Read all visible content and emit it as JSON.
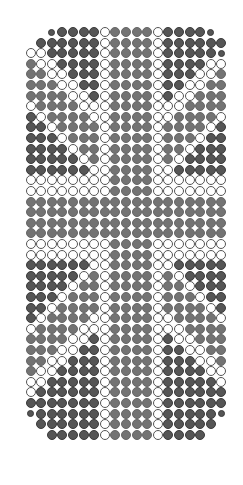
{
  "colors": {
    "dark": "#555555",
    "mid": "#737373",
    "white": "#ffffff",
    "outline": "#555555"
  },
  "grid": {
    "cols": 20,
    "rows": 40,
    "pitch_x": 10.6,
    "pitch_y": 10.6,
    "legend": {
      "D": "dark dot",
      "G": "mid-gray dot",
      "W": "white outlined dot",
      "s": "small dark dot",
      ".": "empty"
    },
    "rows_data": [
      "...sDDDDWGGGGWDDDDs.",
      "..DDDDDDWGGGGWDDDDDD",
      ".WWDDDDDWGGGGWDDDDDs",
      ".GWWDDDDWGGGGWDDDDWW",
      ".GGWWDDDWGGGGWDDDWWG",
      ".GGGWWDDWGGGGWDDWWGG",
      ".GGGGWWDWGGGGWDWWGGG",
      ".WGGGGWWWGGGGWWWGGGG",
      ".DWGGGGWWGGGGWWGGGGW",
      ".DDWGGGGWGGGGWGGGGWD",
      ".DDDWGGGWGGGGWGGGWDD",
      ".DDDDWGGWGGGGWGGWDDD",
      ".DDDDDWGWGGGGWGWDDDD",
      ".DDDDDDWWGGGGWWDDDDD",
      ".WWWWWWWWGGGGWWWWWWW",
      ".WWWWWWWWGGGGWWWWWWW",
      ".GGGGGGGGGGGGGGGGGGG",
      ".GGGGGGGGGGGGGGGGGGG",
      ".GGGGGGGGGGGGGGGGGGG",
      ".GGGGGGGGGGGGGGGGGGG",
      ".WWWWWWWWGGGGWWWWWWW",
      ".WWWWWWWWGGGGWWWWWWW",
      ".DDDDDDWWGGGGWWDDDDD",
      ".DDDDDWGWGGGGWGWDDDD",
      ".DDDDWGGWGGGGWGGWDDD",
      ".DDDWGGGWGGGGWGGGWDD",
      ".DDWGGGGWGGGGWGGGGWD",
      ".DWGGGGWWGGGGWWGGGGW",
      ".WGGGGWWWGGGGWWWGGGG",
      ".GGGGWWDWGGGGWDWWGGG",
      ".GGGWWDDWGGGGWDDWWGG",
      ".GGWWDDDWGGGGWDDDWWG",
      ".GWWDDDDWGGGGWDDDDWW",
      ".WWDDDDDWGGGGWDDDDDW",
      ".WDDDDDDWGGGGWDDDDDD",
      ".DDDDDDDWGGGGWDDDDDD",
      ".sDDDDDDWGGGGWDDDDDs",
      "..DDDDDDWGGGGWDDDDD.",
      "...DDDDDWGGGGWDDDD..",
      "...................."
    ]
  }
}
